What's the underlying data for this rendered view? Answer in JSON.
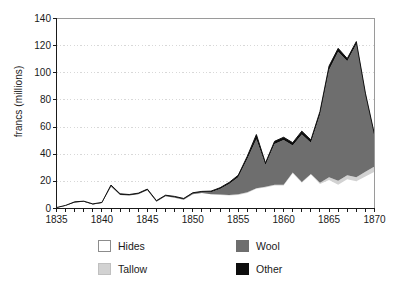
{
  "chart_data": {
    "type": "area",
    "stacked": true,
    "title": "",
    "xlabel": "",
    "ylabel": "francs (millions)",
    "xlim": [
      1835,
      1870
    ],
    "ylim": [
      0,
      140
    ],
    "grid": "horizontal-dotted",
    "legend_position": "bottom",
    "x_tick_labels": [
      "1835",
      "1840",
      "1845",
      "1850",
      "1855",
      "1860",
      "1865",
      "1870"
    ],
    "y_tick_labels": [
      "0",
      "20",
      "40",
      "60",
      "80",
      "100",
      "120",
      "140"
    ],
    "x_tick_step_minor": 1,
    "y_tick_step": 20,
    "x": [
      1835,
      1836,
      1837,
      1838,
      1839,
      1840,
      1841,
      1842,
      1843,
      1844,
      1845,
      1846,
      1847,
      1848,
      1849,
      1850,
      1851,
      1852,
      1853,
      1854,
      1855,
      1856,
      1857,
      1858,
      1859,
      1860,
      1861,
      1862,
      1863,
      1864,
      1865,
      1866,
      1867,
      1868,
      1869,
      1870
    ],
    "series": [
      {
        "name": "Hides",
        "color": "#ffffff",
        "values": [
          0.5,
          2.0,
          4.5,
          5.0,
          3.0,
          4.0,
          16.0,
          10.0,
          9.5,
          10.5,
          13.5,
          5.0,
          9.0,
          8.0,
          6.5,
          10.5,
          11.5,
          10.5,
          10.0,
          9.5,
          10.0,
          11.5,
          14.5,
          15.5,
          17.0,
          17.0,
          26.0,
          19.0,
          25.0,
          18.0,
          21.0,
          17.5,
          21.5,
          20.0,
          23.5,
          27.0
        ]
      },
      {
        "name": "Tallow",
        "color": "#d2d2d2",
        "values": [
          0.0,
          0.0,
          0.0,
          0.0,
          0.0,
          0.0,
          0.0,
          0.0,
          0.0,
          0.0,
          0.0,
          0.0,
          0.0,
          0.0,
          0.0,
          0.0,
          0.0,
          0.0,
          0.3,
          0.5,
          0.5,
          0.5,
          0.5,
          0.5,
          0.5,
          0.5,
          0.5,
          0.5,
          0.5,
          1.0,
          2.0,
          3.0,
          3.0,
          3.0,
          3.5,
          4.0
        ]
      },
      {
        "name": "Wool",
        "color": "#6e6e6e",
        "values": [
          0.0,
          0.0,
          0.0,
          0.0,
          0.0,
          0.0,
          0.5,
          0.2,
          0.2,
          0.2,
          0.2,
          0.2,
          0.2,
          0.3,
          0.3,
          0.5,
          0.5,
          1.5,
          4.0,
          8.0,
          12.5,
          24.5,
          36.0,
          16.0,
          30.0,
          33.0,
          20.0,
          35.0,
          23.0,
          50.0,
          79.0,
          95.0,
          84.0,
          98.0,
          56.0,
          22.0
        ]
      },
      {
        "name": "Other",
        "color": "#0d0d0d",
        "values": [
          0.2,
          0.3,
          0.4,
          0.4,
          0.4,
          0.5,
          0.8,
          0.6,
          0.6,
          0.6,
          0.6,
          0.6,
          0.6,
          0.6,
          0.6,
          0.6,
          0.6,
          0.8,
          1.0,
          1.2,
          1.5,
          2.0,
          3.5,
          1.5,
          2.0,
          2.0,
          2.0,
          2.5,
          2.0,
          2.5,
          3.0,
          2.5,
          2.0,
          2.0,
          2.0,
          1.5
        ]
      }
    ]
  },
  "legend": {
    "items": [
      {
        "label": "Hides",
        "color": "#ffffff",
        "border": "#8c8c8c"
      },
      {
        "label": "Wool",
        "color": "#6e6e6e",
        "border": "#6e6e6e"
      },
      {
        "label": "Tallow",
        "color": "#d2d2d2",
        "border": "#c0c0c0"
      },
      {
        "label": "Other",
        "color": "#0d0d0d",
        "border": "#0d0d0d"
      }
    ]
  },
  "axes": {
    "y_label": "francs (millions)"
  },
  "colors": {
    "axis": "#1a1a1a",
    "frame": "#9a9a9a",
    "grid": "#d8d8d8",
    "outline": "#111111"
  }
}
